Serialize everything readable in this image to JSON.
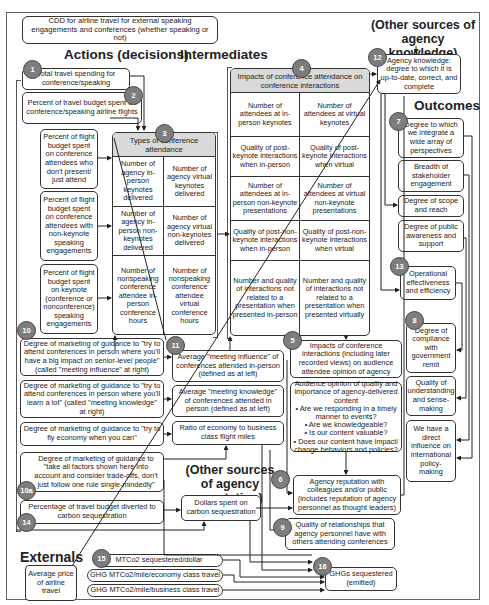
{
  "title": "CDD for airline travel for external speaking engagements and conferences (whether speaking or not)",
  "headers": {
    "actions": "Actions (decisions)",
    "intermediates": "Intermediates",
    "outcomes": "Outcomes",
    "externals": "Externals",
    "other_knowledge": "(Other sources of agency knowledge)",
    "other_reputation": "(Other sources of agency reputation)"
  },
  "actions": {
    "n1": {
      "num": "1",
      "text": "Total travel spending for conference/speaking"
    },
    "n2": {
      "num": "2",
      "text": "Percent of travel budget spent on conference/speaking airline flights"
    },
    "a_just_attend": "Percent of flight budget spent on conference attendees who don't present/ just attend",
    "a_non_keynote": "Percent of flight budget spent on conference attendees with non-keynote speaking engagements",
    "a_keynote": "Percent of flight budget spent on keynote (conference or nonconference) speaking engagements",
    "n10": {
      "num": "10",
      "items": [
        "Degree of marketing of guidance to \"try to attend conferences in person where you'll have a big impact on senior-level people\" (called \"meeting influence\" at right)",
        "Degree of marketing of guidance to \"try to attend conferences in person where you'll learn a lot\" (called \"meeting knowledge\" at right)",
        "Degree of marketing of guidance to \"try to fly economy when you can\""
      ]
    },
    "n10a": {
      "num": "10a",
      "text": "Degree of marketing of guidance to \"take all factors shown here into account and consider trade-offs, don't just follow one rule single-mindedly\""
    },
    "n14": {
      "num": "14",
      "text": "Percentage of travel budget diverted to carbon sequestration"
    }
  },
  "table3": {
    "num": "3",
    "header": "Types of conference attendance",
    "cells": [
      "Number of agency in-person keynotes delivered",
      "Number of agency virtual keynotes delivered",
      "Number of agency in-person non-keynotes delivered",
      "Number of agency virtual non-keynotes delivered",
      "Number of nonspeaking conference attendee in-person conference hours",
      "Number of nonspeaking conference attendee virtual conference hours"
    ]
  },
  "table4": {
    "num": "4",
    "header": "Impacts of conference attendance on conference interactions",
    "cells": [
      "Number of attendees at in-person keynotes",
      "Number of attendees at virtual keynotes",
      "Quality of post-keynote interactions when in-person",
      "Quality of post-keynote interactions when virtual",
      "Number of attendees at in-person non-keynote presentations",
      "Number of attendees at virtual non-keynote presentations",
      "Quality of post-non-keynote interactions when in-person",
      "Quality of post-non-keynote interactions when virtual",
      "Number and quality of interactions not related to a presentation when presented in-person",
      "Number and quality of interactions not related to a presentation when presented virtually"
    ]
  },
  "intermediates": {
    "n11": {
      "num": "11",
      "items": [
        "Average \"meeting influence\" of conferences attended in-person (defined as at left)",
        "Average \"meeting knowledge\" of conferences attended in person (defined as at left)",
        "Ratio of economy to business class flight miles"
      ]
    },
    "n5": {
      "num": "5",
      "text": "Impacts of conference interactions (including later recorded views) on audience attendee opinion of agency"
    },
    "audience": {
      "lead": "Audience opinion of quality and importance of agency-delivered content",
      "bullets": [
        "• Are we responding in a timely manner to events?",
        "• Are we knowledgeable?",
        "• Is our content valuable?",
        "• Does our content have impact/ change behaviors and policies?"
      ]
    },
    "n6": {
      "num": "6",
      "text": "Agency reputation with colleagues and/or public (includes reputation of agency personnel as thought leaders)"
    },
    "n9": {
      "num": "9",
      "text": "Quality of relationships that agency personnel have with others attending conferences"
    },
    "dollars_seq": "Dollars spent on carbon sequestration",
    "n16": {
      "num": "16",
      "text": "GHGs sequestered (emitted)"
    }
  },
  "outcomes": {
    "n12": {
      "num": "12",
      "text": "Agency knowledge: degree to which it is up-to-date, correct, and complete"
    },
    "n7": {
      "num": "7",
      "items": [
        "Degree to which we integrate a wide array of perspectives",
        "Breadth of stakeholder engagement",
        "Degree of scope and reach",
        "Degree of public awareness and support"
      ]
    },
    "n13": {
      "num": "13",
      "text": "Operational effectiveness and efficiency"
    },
    "n8": {
      "num": "8",
      "items": [
        "Degree of compliance with government remit",
        "Quality of understanding and sense-making",
        "We have a direct influence on international policy-making"
      ]
    }
  },
  "externals": {
    "n15": {
      "num": "15",
      "items": [
        "MTCo2 sequestered/dollar",
        "GHG MTCo2/mile/economy class travel",
        "GHG MTCo2/mile/business class travel"
      ]
    },
    "avg_price": "Average price of airline travel"
  }
}
